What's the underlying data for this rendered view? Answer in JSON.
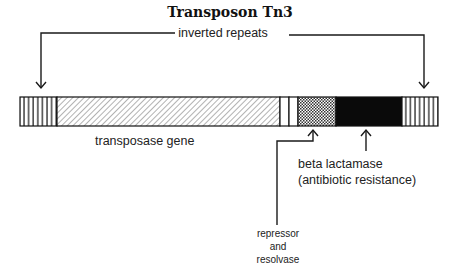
{
  "diagram": {
    "title": "Transposon Tn3",
    "inverted_repeats_label": "inverted repeats",
    "labels": {
      "transposase": "transposase gene",
      "beta_lactamase_line1": "beta lactamase",
      "beta_lactamase_line2": "(antibiotic resistance)",
      "repressor_line1": "repressor",
      "repressor_line2": "and",
      "repressor_line3": "resolvase"
    },
    "segments": [
      {
        "name": "left inverted repeat",
        "pattern": "vertical-stripes",
        "x_start": 20,
        "x_end": 57
      },
      {
        "name": "transposase gene",
        "pattern": "diagonal-hatch",
        "x_start": 57,
        "x_end": 280
      },
      {
        "name": "spacer 1",
        "pattern": "blank",
        "x_start": 280,
        "x_end": 289
      },
      {
        "name": "spacer 2",
        "pattern": "blank",
        "x_start": 289,
        "x_end": 298
      },
      {
        "name": "repressor and resolvase",
        "pattern": "crosshatch",
        "x_start": 298,
        "x_end": 336
      },
      {
        "name": "beta lactamase",
        "pattern": "solid-black",
        "x_start": 336,
        "x_end": 402
      },
      {
        "name": "right inverted repeat",
        "pattern": "vertical-stripes",
        "x_start": 402,
        "x_end": 438
      }
    ],
    "colors": {
      "ink": "#111111",
      "background": "#ffffff"
    }
  }
}
